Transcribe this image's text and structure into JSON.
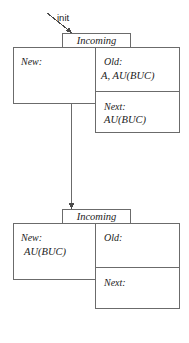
{
  "diagram": {
    "init": {
      "label": "init",
      "arrow_icon": "arrow-down-right-icon"
    },
    "edge": {
      "arrow_icon": "arrow-down-icon"
    },
    "colors": {
      "stroke": "#6b6b6b",
      "text": "#1b1b1b",
      "background": "#ffffff"
    },
    "nodes": [
      {
        "id": "node-top",
        "tab_label": "Incoming",
        "fields": [
          {
            "key": "new",
            "label": "New:",
            "value": ""
          },
          {
            "key": "old",
            "label": "Old:",
            "value": "A, AU(BUC)"
          },
          {
            "key": "next",
            "label": "Next:",
            "value": "AU(BUC)"
          }
        ]
      },
      {
        "id": "node-bottom",
        "tab_label": "Incoming",
        "fields": [
          {
            "key": "new",
            "label": "New:",
            "value": "AU(BUC)"
          },
          {
            "key": "old",
            "label": "Old:",
            "value": ""
          },
          {
            "key": "next",
            "label": "Next:",
            "value": ""
          }
        ]
      }
    ]
  }
}
